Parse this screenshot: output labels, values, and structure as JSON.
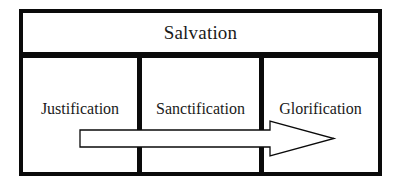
{
  "diagram": {
    "title": "Salvation",
    "stages": [
      {
        "label": "Justification"
      },
      {
        "label": "Sanctification"
      },
      {
        "label": "Glorification"
      }
    ],
    "arrow": {
      "direction": "right",
      "from": "Justification",
      "to": "Glorification",
      "fill": "#ffffff",
      "stroke": "#0a0a0a"
    },
    "colors": {
      "border": "#0a0a0a",
      "background": "#ffffff",
      "text": "#1a1a1a"
    }
  }
}
